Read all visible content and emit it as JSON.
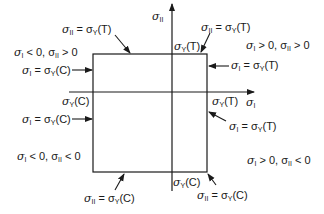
{
  "diagram": {
    "type": "yield-locus-max-normal-stress",
    "axes": {
      "horizontal": {
        "symbol": "σ",
        "subscript": "I"
      },
      "vertical": {
        "symbol": "σ",
        "subscript": "II"
      }
    },
    "axis_ticks": {
      "h_left": {
        "sym": "σ",
        "sub": "Y",
        "suffix": "(C)"
      },
      "h_right": {
        "sym": "σ",
        "sub": "Y",
        "suffix": "(T)"
      },
      "v_top": {
        "sym": "σ",
        "sub": "Y",
        "suffix": "(T)"
      },
      "v_bottom": {
        "sym": "σ",
        "sub": "Y",
        "suffix": "(C)"
      }
    },
    "quadrants": {
      "q1": {
        "text": "σI > 0, σII > 0",
        "a": "σ",
        "as": "I",
        "b": " > 0, σ",
        "bs": "II",
        "c": " > 0"
      },
      "q2": {
        "text": "σI < 0, σII > 0",
        "a": "σ",
        "as": "I",
        "b": " < 0, σ",
        "bs": "II",
        "c": " > 0"
      },
      "q3": {
        "text": "σI < 0, σII < 0",
        "a": "σ",
        "as": "I",
        "b": " < 0, σ",
        "bs": "II",
        "c": " < 0"
      },
      "q4": {
        "text": "σI > 0, σII < 0",
        "a": "σ",
        "as": "I",
        "b": " > 0, σ",
        "bs": "II",
        "c": " < 0"
      }
    },
    "edge_labels": {
      "top_left": {
        "lhs": "σ",
        "lhs_sub": "II",
        "eq": " = σ",
        "rhs_sub": "Y",
        "rhs": "(T)"
      },
      "top_right": {
        "lhs": "σ",
        "lhs_sub": "II",
        "eq": " = σ",
        "rhs_sub": "Y",
        "rhs": "(T)"
      },
      "left_upper": {
        "lhs": "σ",
        "lhs_sub": "I",
        "eq": " = σ",
        "rhs_sub": "Y",
        "rhs": "(C)"
      },
      "left_lower": {
        "lhs": "σ",
        "lhs_sub": "I",
        "eq": " = σ",
        "rhs_sub": "Y",
        "rhs": "(C)"
      },
      "right_upper": {
        "lhs": "σ",
        "lhs_sub": "I",
        "eq": " = σ",
        "rhs_sub": "Y",
        "rhs": "(T)"
      },
      "right_lower": {
        "lhs": "σ",
        "lhs_sub": "I",
        "eq": " = σ",
        "rhs_sub": "Y",
        "rhs": "(T)"
      },
      "bottom_left": {
        "lhs": "σ",
        "lhs_sub": "II",
        "eq": " = σ",
        "rhs_sub": "Y",
        "rhs": "(C)"
      },
      "bottom_right": {
        "lhs": "σ",
        "lhs_sub": "II",
        "eq": " = σ",
        "rhs_sub": "Y",
        "rhs": "(C)"
      }
    },
    "colors": {
      "line": "#1a1a1a",
      "background": "#ffffff"
    }
  }
}
